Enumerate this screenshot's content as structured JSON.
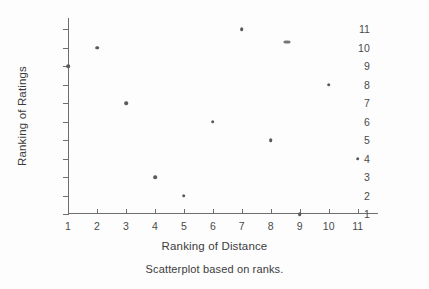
{
  "chart_data": {
    "type": "scatter",
    "title": "",
    "caption": "Scatterplot based on ranks.",
    "xlabel": "Ranking of Distance",
    "ylabel": "Ranking of Ratings",
    "xlim": [
      1,
      11.7
    ],
    "ylim": [
      1,
      11.6
    ],
    "xticks": [
      1,
      2,
      3,
      4,
      5,
      6,
      7,
      8,
      9,
      10,
      11
    ],
    "yticks": [
      1,
      2,
      3,
      4,
      5,
      6,
      7,
      8,
      9,
      10,
      11
    ],
    "xtick_labels": [
      "1",
      "2",
      "3",
      "4",
      "5",
      "6",
      "7",
      "8",
      "9",
      "10",
      "11"
    ],
    "ytick_labels": [
      "1",
      "2",
      "3",
      "4",
      "5",
      "6",
      "7",
      "8",
      "9",
      "10",
      "11"
    ],
    "grid": false,
    "legend": null,
    "marker_color": "#5a5a5d",
    "axis_color": "#6e6e70",
    "background": "#fdfdfd",
    "series": [
      {
        "name": "ranks",
        "points": [
          {
            "x": 1,
            "y": 9,
            "note": "on y-axis"
          },
          {
            "x": 2,
            "y": 10
          },
          {
            "x": 3,
            "y": 7
          },
          {
            "x": 4,
            "y": 3
          },
          {
            "x": 5,
            "y": 2
          },
          {
            "x": 6,
            "y": 6
          },
          {
            "x": 7,
            "y": 11
          },
          {
            "x": 8,
            "y": 5
          },
          {
            "x": 8.55,
            "y": 10.3,
            "smudge": true
          },
          {
            "x": 9,
            "y": 1,
            "note": "on x-axis"
          },
          {
            "x": 10,
            "y": 8
          },
          {
            "x": 11,
            "y": 4
          }
        ]
      }
    ]
  }
}
